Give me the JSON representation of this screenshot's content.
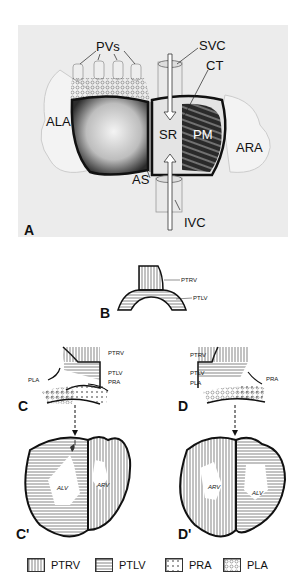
{
  "panel_a": {
    "label": "A",
    "structures": {
      "pvs": "PVs",
      "svc": "SVC",
      "ct": "CT",
      "ala": "ALA",
      "sr": "SR",
      "pm": "PM",
      "ara": "ARA",
      "as": "AS",
      "ivc": "IVC"
    }
  },
  "panel_b": {
    "label": "B",
    "ptrv": "PTRV",
    "ptlv": "PTLV"
  },
  "panel_c": {
    "label": "C",
    "ptrv": "PTRV",
    "ptlv": "PTLV",
    "pla": "PLA",
    "pra": "PRA"
  },
  "panel_d": {
    "label": "D",
    "ptrv": "PTRV",
    "ptlv": "PTLV",
    "pla": "PLA",
    "pra": "PRA"
  },
  "panel_c_prime": {
    "label": "C'",
    "alv": "ALV",
    "arv": "ARV"
  },
  "panel_d_prime": {
    "label": "D'",
    "arv": "ARV",
    "alv": "ALV"
  },
  "legend": [
    {
      "key": "ptrv",
      "label": "PTRV",
      "pattern": "vertical-lines"
    },
    {
      "key": "ptlv",
      "label": "PTLV",
      "pattern": "horizontal-lines"
    },
    {
      "key": "pra",
      "label": "PRA",
      "pattern": "crosses"
    },
    {
      "key": "pla",
      "label": "PLA",
      "pattern": "circles"
    }
  ]
}
